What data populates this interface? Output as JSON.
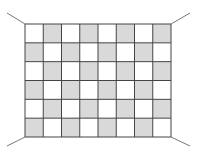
{
  "grid": {
    "columns": 8,
    "rows": 6,
    "left": 25,
    "top": 24,
    "right": 171,
    "bottom": 137,
    "pattern": "checkerboard",
    "first_cell": "white",
    "colors": {
      "light": "#ffffff",
      "dark": "#d9d9d9",
      "line": "#444444",
      "corner_line": "#777777"
    }
  },
  "corner_lines": [
    {
      "name": "top-left",
      "x1": 7,
      "y1": 13,
      "x2": 25,
      "y2": 24
    },
    {
      "name": "top-right",
      "x1": 171,
      "y1": 24,
      "x2": 190,
      "y2": 13
    },
    {
      "name": "bottom-left",
      "x1": 25,
      "y1": 137,
      "x2": 7,
      "y2": 146
    },
    {
      "name": "bottom-right",
      "x1": 171,
      "y1": 137,
      "x2": 190,
      "y2": 146
    }
  ]
}
